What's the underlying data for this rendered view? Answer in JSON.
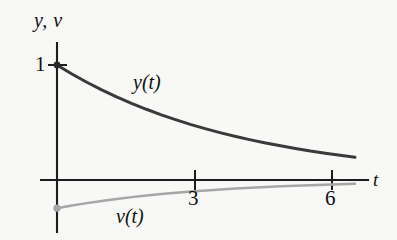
{
  "figure": {
    "background_color": "#f8f8f6",
    "axis_color": "#1d1d1d"
  },
  "axes": {
    "y_axis_label": "y, v",
    "x_axis_label": "t",
    "x_ticks": [
      {
        "label": "3",
        "value": 3
      },
      {
        "label": "6",
        "value": 6
      }
    ],
    "y_ticks": [
      {
        "label": "1",
        "value": 1
      }
    ]
  },
  "labels": {
    "curve_y": "y(t)",
    "curve_v": "v(t)"
  },
  "chart_data": {
    "type": "line",
    "title": "",
    "xlabel": "t",
    "ylabel": "y, v",
    "xlim": [
      0,
      6.8
    ],
    "ylim": [
      -0.3,
      1.1
    ],
    "grid": false,
    "legend": "inline-annotations",
    "xticks": [
      3,
      6
    ],
    "yticks": [
      1
    ],
    "series": [
      {
        "name": "y(t)",
        "color": "#3a3a3a",
        "linewidth": 3,
        "marker_at_start": true,
        "x": [
          0,
          0.34,
          0.68,
          1.02,
          1.36,
          1.7,
          2.04,
          2.38,
          2.72,
          3.06,
          3.4,
          3.74,
          4.08,
          4.42,
          4.76,
          5.1,
          5.44,
          5.78,
          6.12,
          6.46,
          6.8
        ],
        "y": [
          1.0,
          0.922,
          0.85,
          0.784,
          0.723,
          0.667,
          0.615,
          0.567,
          0.523,
          0.482,
          0.445,
          0.41,
          0.378,
          0.349,
          0.322,
          0.297,
          0.274,
          0.252,
          0.233,
          0.215,
          0.198
        ]
      },
      {
        "name": "v(t)",
        "color": "#a6a6a6",
        "linewidth": 2.5,
        "marker_at_start": true,
        "x": [
          0,
          0.34,
          0.68,
          1.02,
          1.36,
          1.7,
          2.04,
          2.38,
          2.72,
          3.06,
          3.4,
          3.74,
          4.08,
          4.42,
          4.76,
          5.1,
          5.44,
          5.78,
          6.12,
          6.46,
          6.8
        ],
        "y": [
          -0.245,
          -0.222,
          -0.201,
          -0.182,
          -0.165,
          -0.149,
          -0.135,
          -0.122,
          -0.111,
          -0.1,
          -0.091,
          -0.082,
          -0.074,
          -0.067,
          -0.061,
          -0.055,
          -0.05,
          -0.045,
          -0.041,
          -0.037,
          -0.033
        ]
      }
    ],
    "annotations": [
      {
        "text": "y(t)",
        "x": 2.1,
        "y": 0.78
      },
      {
        "text": "v(t)",
        "x": 1.7,
        "y": -0.26
      }
    ]
  }
}
